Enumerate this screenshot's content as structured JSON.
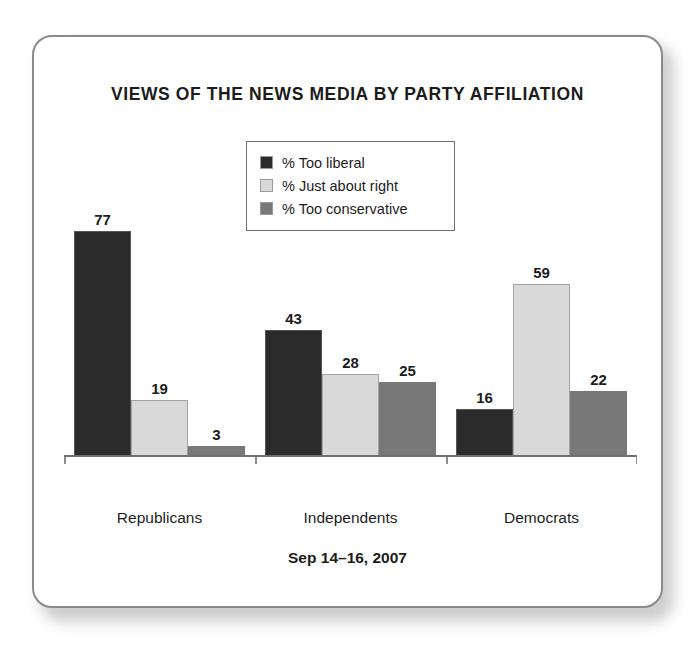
{
  "card": {
    "title": "VIEWS OF THE NEWS MEDIA BY PARTY AFFILIATION",
    "footnote": "Sep 14–16, 2007"
  },
  "legend": {
    "entries": [
      {
        "label": "% Too liberal",
        "color": "#2b2b2b"
      },
      {
        "label": "% Just about right",
        "color": "#d9d9d9"
      },
      {
        "label": "% Too conservative",
        "color": "#787878"
      }
    ]
  },
  "chart_data": {
    "type": "bar",
    "title": "VIEWS OF THE NEWS MEDIA BY PARTY AFFILIATION",
    "subtitle": "Sep 14–16, 2007",
    "xlabel": "",
    "ylabel": "",
    "ylim": [
      0,
      85
    ],
    "grid": false,
    "legend_position": "top-center",
    "categories": [
      "Republicans",
      "Independents",
      "Democrats"
    ],
    "series": [
      {
        "name": "% Too liberal",
        "color": "#2b2b2b",
        "values": [
          77,
          43,
          16
        ]
      },
      {
        "name": "% Just about right",
        "color": "#d9d9d9",
        "values": [
          19,
          28,
          59
        ]
      },
      {
        "name": "% Too conservative",
        "color": "#787878",
        "values": [
          3,
          25,
          22
        ]
      }
    ],
    "data_labels": [
      [
        "77",
        "19",
        "3"
      ],
      [
        "43",
        "28",
        "25"
      ],
      [
        "16",
        "59",
        "22"
      ]
    ]
  }
}
